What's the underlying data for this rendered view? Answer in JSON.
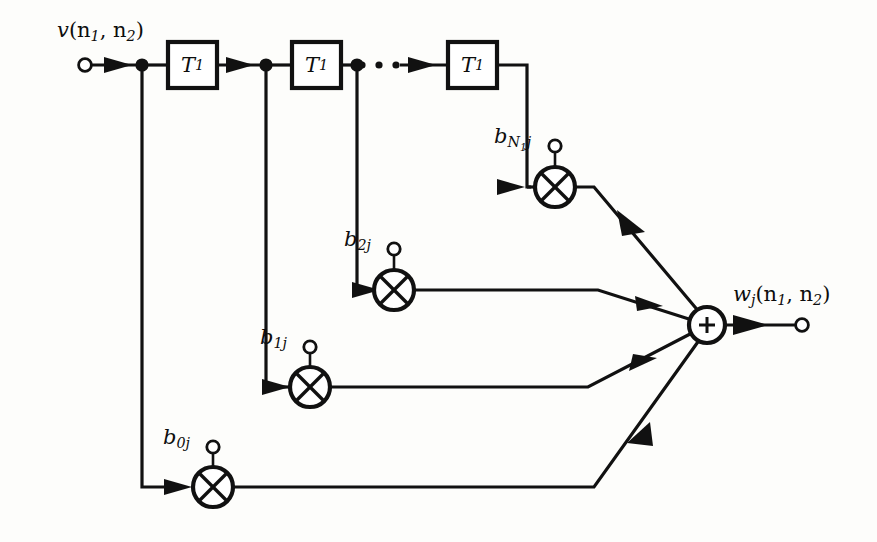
{
  "diagram": {
    "background_color": "#fdfdfb",
    "line_color": "#111111",
    "input": {
      "label_main": "v",
      "label_args": "(n",
      "sub1": "1",
      "mid": ", n",
      "sub2": "2",
      "close": ")",
      "full_label": "v(n1, n2)"
    },
    "output": {
      "label_main": "w",
      "label_sub": "j",
      "label_args": "(n",
      "sub1": "1",
      "mid": ", n",
      "sub2": "2",
      "close": ")",
      "full_label": "wj(n1, n2)"
    },
    "delay_blocks": [
      {
        "name": "delay-1",
        "symbol": "T",
        "subscript": "1"
      },
      {
        "name": "delay-2",
        "symbol": "T",
        "subscript": "1"
      },
      {
        "name": "delay-3",
        "symbol": "T",
        "subscript": "1"
      }
    ],
    "ellipsis": "· · ·",
    "coefficients": [
      {
        "name": "coef-b0j",
        "symbol": "b",
        "subscript": "0j"
      },
      {
        "name": "coef-b1j",
        "symbol": "b",
        "subscript": "1j"
      },
      {
        "name": "coef-b2j",
        "symbol": "b",
        "subscript": "2j"
      },
      {
        "name": "coef-bN1j",
        "symbol": "b",
        "sub_upper": "N",
        "sub_lower": "1",
        "sub_tail": "j",
        "subscript": "N1j"
      }
    ],
    "multipliers": [
      {
        "name": "multiplier-b0j",
        "symbol": "x"
      },
      {
        "name": "multiplier-b1j",
        "symbol": "x"
      },
      {
        "name": "multiplier-b2j",
        "symbol": "x"
      },
      {
        "name": "multiplier-bN1j",
        "symbol": "x"
      }
    ],
    "adder": {
      "name": "summing-junction",
      "symbol": "+"
    }
  }
}
